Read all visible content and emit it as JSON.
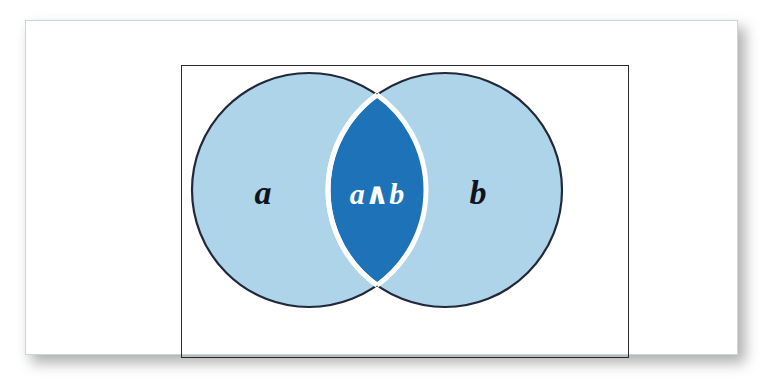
{
  "figure": {
    "type": "venn-diagram",
    "background_color": "#ffffff",
    "card": {
      "fill": "#ffffff",
      "border_color": "#c3d9e2",
      "shadow_color": "#7e7e7e"
    },
    "universe_box": {
      "name": "universe-rectangle",
      "border_color": "#2e2b27",
      "fill": "none"
    },
    "colors": {
      "set_fill": "#ADD4E8",
      "intersection_fill": "#1D72B8",
      "outline": "#22283a",
      "intersection_outline": "#ffffff",
      "label_dark": "#10131e",
      "label_light": "#ffffff"
    },
    "sets": [
      {
        "id": "set-a",
        "label": "a",
        "label_color": "#10131e",
        "cx": 309,
        "cy": 190,
        "r": 117,
        "label_x": 263,
        "label_y": 204,
        "font_size": 34
      },
      {
        "id": "set-b",
        "label": "b",
        "label_color": "#10131e",
        "cx": 445,
        "cy": 190,
        "r": 117,
        "label_x": 478,
        "label_y": 204,
        "font_size": 34
      }
    ],
    "intersection": {
      "id": "set-a-and-b",
      "label": "a∧b",
      "label_color": "#ffffff",
      "label_x": 377,
      "label_y": 204,
      "font_size": 30,
      "operator": "∧",
      "operator_name": "logical-and"
    }
  }
}
